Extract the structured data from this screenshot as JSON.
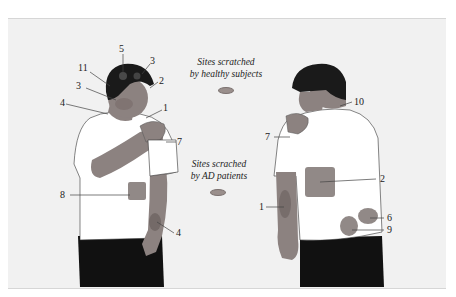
{
  "legend": {
    "healthy": {
      "line1": "Sites scratched",
      "line2": "by healthy subjects"
    },
    "ad": {
      "line1": "Sites scrached",
      "line2": "by AD patients"
    }
  },
  "colors": {
    "background": "#f1f1f1",
    "skin": "#8c8280",
    "shirt": "#ffffff",
    "hair": "#1a1a1a",
    "pants": "#111111",
    "scratch_site": "#8e8482"
  },
  "front_figure": {
    "labels": [
      "5",
      "3",
      "11",
      "2",
      "3",
      "4",
      "1",
      "7",
      "8",
      "4"
    ]
  },
  "back_figure": {
    "labels": [
      "10",
      "7",
      "2",
      "1",
      "6",
      "9"
    ]
  }
}
